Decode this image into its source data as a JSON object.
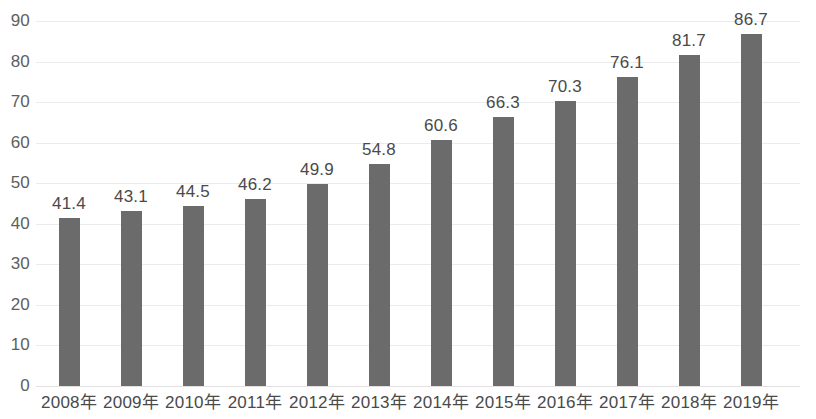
{
  "chart_data": {
    "type": "bar",
    "title": "",
    "subtitle": "",
    "xlabel": "",
    "ylabel": "",
    "categories": [
      "2008年",
      "2009年",
      "2010年",
      "2011年",
      "2012年",
      "2013年",
      "2014年",
      "2015年",
      "2016年",
      "2017年",
      "2018年",
      "2019年"
    ],
    "values": [
      41.4,
      43.1,
      44.5,
      46.2,
      49.9,
      54.8,
      60.6,
      66.3,
      70.3,
      76.1,
      81.7,
      86.7
    ],
    "data_labels": [
      "41.4",
      "43.1",
      "44.5",
      "46.2",
      "49.9",
      "54.8",
      "60.6",
      "66.3",
      "70.3",
      "76.1",
      "81.7",
      "86.7"
    ],
    "ylim": [
      0,
      90
    ],
    "y_tick_values": [
      90,
      80,
      70,
      60,
      50,
      40,
      30,
      20,
      10,
      0
    ],
    "y_tick_labels": [
      "90",
      "80",
      "70",
      "60",
      "50",
      "40",
      "30",
      "20",
      "10",
      "0"
    ],
    "y_tick_interval": 10,
    "grid": {
      "horizontal": true,
      "vertical": false,
      "color": "#eceaea"
    },
    "legend": {
      "visible": false,
      "position": "none",
      "entries": []
    },
    "series": [
      {
        "name": "",
        "color": "#6b6b6b",
        "values": [
          41.4,
          43.1,
          44.5,
          46.2,
          49.9,
          54.8,
          60.6,
          66.3,
          70.3,
          76.1,
          81.7,
          86.7
        ]
      }
    ],
    "colors": {
      "bar": "#6b6b6b",
      "gridline": "#eceaea",
      "axis_text": "#5e5e5e",
      "label_text": "#4a4a4a",
      "background": "#ffffff"
    },
    "annotations": []
  }
}
